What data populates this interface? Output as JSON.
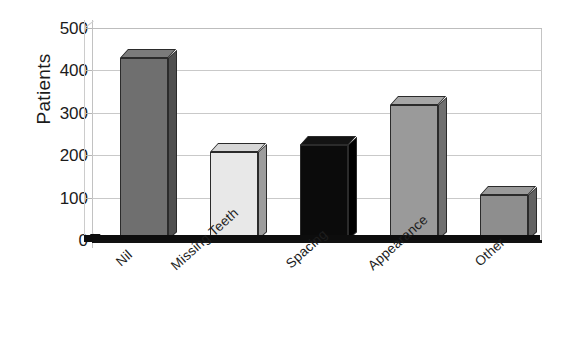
{
  "chart_data": {
    "type": "bar",
    "title": "",
    "subtitle": "",
    "xlabel": "",
    "ylabel": "Patients",
    "categories": [
      "Nil",
      "Missing Teeth",
      "Spacing",
      "Appearance",
      "Other"
    ],
    "values": [
      430,
      208,
      224,
      318,
      106
    ],
    "series": [
      {
        "name": "Patients",
        "values": [
          430,
          208,
          224,
          318,
          106
        ]
      }
    ],
    "bar_colors": [
      "#6f6f6f",
      "#e8e8e8",
      "#0b0b0b",
      "#9a9a9a",
      "#8e8e8e"
    ],
    "bar_top_colors": [
      "#7b7b7b",
      "#d7d7d7",
      "#131313",
      "#a6a6a6",
      "#9a9a9a"
    ],
    "bar_side_colors": [
      "#4f4f4f",
      "#9d9d9d",
      "#000000",
      "#6f6f6f",
      "#636363"
    ],
    "ylim": [
      0,
      500
    ],
    "ytick_labels": [
      "0",
      "100",
      "200",
      "300",
      "400",
      "500"
    ],
    "ytick_values": [
      0,
      100,
      200,
      300,
      400,
      500
    ],
    "grid": true,
    "grid_axis": "y",
    "legend": false,
    "legend_position": "none",
    "style": "3d-bars-grayscale",
    "xtick_rotation_deg": -42,
    "background": "#ffffff",
    "grid_color": "#c9c9c9",
    "axis_color": "#c2c2c2",
    "baseline_color": "#0d0d0d",
    "text_color": "#1b1b1b"
  }
}
